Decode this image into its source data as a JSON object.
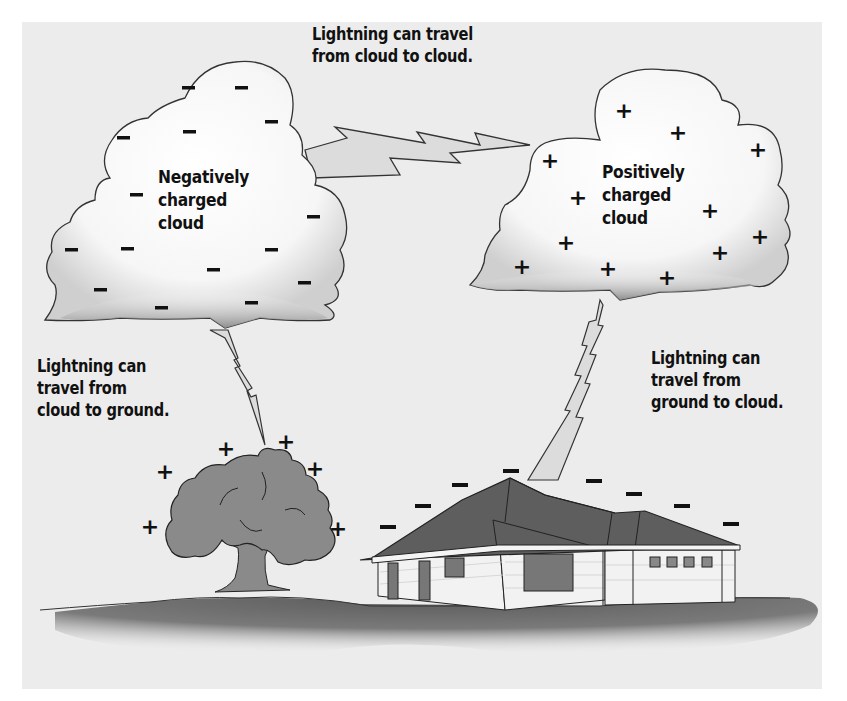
{
  "diagram": {
    "background_color": "#ececec",
    "labels": {
      "cloud_to_cloud": [
        "Lightning can travel",
        "from cloud to cloud."
      ],
      "negative_cloud": [
        "Negatively",
        "charged",
        "cloud"
      ],
      "positive_cloud": [
        "Positively",
        "charged",
        "cloud"
      ],
      "cloud_to_ground": [
        "Lightning can",
        "travel from",
        "cloud to ground."
      ],
      "ground_to_cloud": [
        "Lightning can",
        "travel from",
        "ground to cloud."
      ]
    },
    "charges": {
      "negative_cloud_symbol": "−",
      "positive_cloud_symbol": "+",
      "tree_symbol": "+",
      "house_symbol": "−"
    },
    "icons": {
      "negative_cloud": "cloud-icon",
      "positive_cloud": "cloud-icon",
      "tree": "tree-icon",
      "house": "house-icon",
      "bolt": "lightning-bolt-icon"
    }
  }
}
